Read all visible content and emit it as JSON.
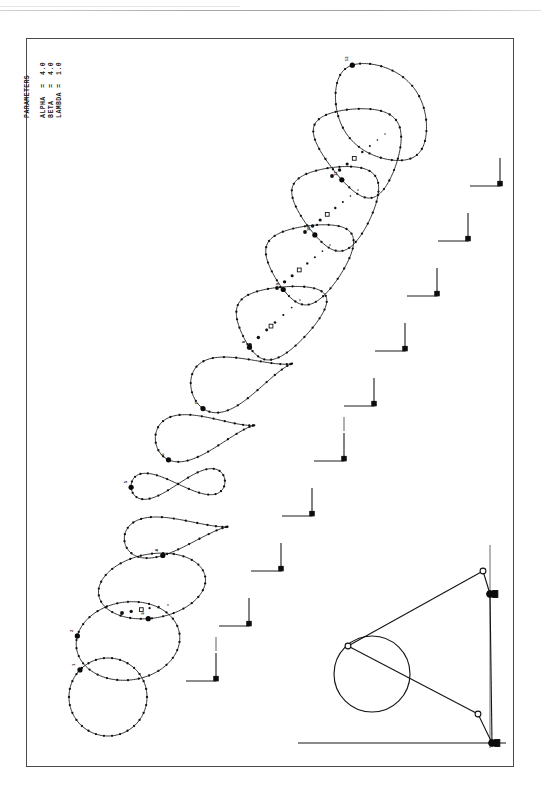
{
  "figure": {
    "background_color": "#ffffff",
    "ink_color": "#101010",
    "frame": {
      "x": 26,
      "y": 38,
      "width": 486,
      "height": 727,
      "border_color": "#4a4a4a"
    }
  },
  "parameters": {
    "heading": "PARAMETERS",
    "lines": [
      {
        "name": "ALPHA",
        "operator": "=",
        "value": "4.0"
      },
      {
        "name": "BETA",
        "operator": "=",
        "value": "4.0"
      },
      {
        "name": "LAMBDA",
        "operator": "=",
        "value": "1.0"
      }
    ],
    "text_block": "PARAMETERS\n\nALPHA  =  4.0\nBETA   =  4.0\nLAMBDA =  1.0",
    "orientation": "rotated-90-ccw"
  },
  "chart_data": {
    "type": "line",
    "xlabel": "",
    "ylabel": "",
    "grid": false,
    "legend": "none",
    "series": [
      {
        "name": "curve-1",
        "shape": "circle",
        "label": "1",
        "cx": 108,
        "cy": 697,
        "rx": 39,
        "ry": 39,
        "rot": 0,
        "samples": 30,
        "marker_label_at": 0.62
      },
      {
        "name": "curve-2",
        "shape": "ellipse",
        "label": "2",
        "cx": 128,
        "cy": 641,
        "rx": 52,
        "ry": 39,
        "rot": -8,
        "samples": 30,
        "marker_label_at": 0.55
      },
      {
        "name": "curve-3",
        "shape": "ellipse",
        "label": "3",
        "cx": 152,
        "cy": 586,
        "rx": 54,
        "ry": 32,
        "rot": -10,
        "samples": 30,
        "marker_label_at": 0.28
      },
      {
        "name": "curve-4",
        "shape": "teardrop",
        "label": "4",
        "cx": 176,
        "cy": 534,
        "rx": 52,
        "ry": 20,
        "rot": -8,
        "samples": 28,
        "marker_label_at": 0.3
      },
      {
        "name": "curve-5",
        "shape": "figure-eight",
        "label": "5",
        "cx": 178,
        "cy": 484,
        "rx": 47,
        "ry": 13,
        "rot": -4,
        "samples": 28,
        "marker_label_at": 0.5
      },
      {
        "name": "curve-6",
        "shape": "teardrop",
        "label": "6",
        "cx": 205,
        "cy": 434,
        "rx": 50,
        "ry": 23,
        "rot": -10,
        "samples": 28,
        "marker_label_at": 0.4
      },
      {
        "name": "curve-7",
        "shape": "teardrop",
        "label": "7",
        "cx": 242,
        "cy": 378,
        "rx": 52,
        "ry": 27,
        "rot": -16,
        "samples": 28,
        "marker_label_at": 0.42
      },
      {
        "name": "curve-8",
        "shape": "crescent",
        "label": "8",
        "cx": 272,
        "cy": 322,
        "rx": 46,
        "ry": 34,
        "rot": -26,
        "samples": 28,
        "marker_label_at": 0.45
      },
      {
        "name": "curve-9",
        "shape": "crescent",
        "label": "9",
        "cx": 303,
        "cy": 264,
        "rx": 44,
        "ry": 38,
        "rot": -32,
        "samples": 28,
        "marker_label_at": 0.46
      },
      {
        "name": "curve-10",
        "shape": "crescent",
        "label": "10",
        "cx": 331,
        "cy": 208,
        "rx": 42,
        "ry": 42,
        "rot": -36,
        "samples": 28,
        "marker_label_at": 0.46
      },
      {
        "name": "curve-11",
        "shape": "crescent",
        "label": "11",
        "cx": 355,
        "cy": 152,
        "rx": 40,
        "ry": 47,
        "rot": -38,
        "samples": 28,
        "marker_label_at": 0.46
      },
      {
        "name": "curve-12",
        "shape": "lens",
        "label": "12",
        "cx": 381,
        "cy": 112,
        "rx": 37,
        "ry": 56,
        "rot": -40,
        "samples": 28,
        "marker_label_at": 0.46
      }
    ],
    "dotted_trails": [
      {
        "name": "trail-a",
        "from": [
          250,
          345
        ],
        "to": [
          300,
          300
        ],
        "dots": 7
      },
      {
        "name": "trail-b",
        "from": [
          277,
          288
        ],
        "to": [
          330,
          245
        ],
        "dots": 8
      },
      {
        "name": "trail-c",
        "from": [
          305,
          232
        ],
        "to": [
          358,
          190
        ],
        "dots": 8
      },
      {
        "name": "trail-d",
        "from": [
          332,
          176
        ],
        "to": [
          385,
          134
        ],
        "dots": 8
      },
      {
        "name": "trail-e",
        "from": [
          122,
          613
        ],
        "to": [
          168,
          605
        ],
        "dots": 6
      }
    ],
    "axis_markers": {
      "count": 10,
      "description": "Small L-shaped coordinate-axis crosshairs stepping diagonally down-left, one per coupler curve position",
      "positions": [
        [
          500,
          186
        ],
        [
          468,
          241
        ],
        [
          437,
          296
        ],
        [
          405,
          351
        ],
        [
          374,
          406
        ],
        [
          344,
          461
        ],
        [
          312,
          516
        ],
        [
          281,
          571
        ],
        [
          249,
          626
        ],
        [
          216,
          681
        ]
      ]
    }
  },
  "mechanism": {
    "name": "four-bar-linkage",
    "description": "Crank-rocker linkage drawn in the lower right corner with the coupler point circle",
    "circle": {
      "cx": 372,
      "cy": 674,
      "r": 38
    },
    "joints": [
      {
        "name": "coupler-point",
        "x": 348,
        "y": 646,
        "type": "open"
      },
      {
        "name": "upper-crank-pin",
        "x": 483,
        "y": 571,
        "type": "open"
      },
      {
        "name": "upper-ground",
        "x": 490,
        "y": 594,
        "type": "fixed"
      },
      {
        "name": "lower-crank-pin",
        "x": 478,
        "y": 714,
        "type": "open"
      },
      {
        "name": "lower-ground",
        "x": 492,
        "y": 743,
        "type": "fixed"
      }
    ],
    "links": [
      {
        "name": "coupler-upper",
        "from": "coupler-point",
        "to": "upper-crank-pin"
      },
      {
        "name": "crank-upper",
        "from": "upper-crank-pin",
        "to": "upper-ground"
      },
      {
        "name": "coupler-lower",
        "from": "coupler-point",
        "to": "lower-crank-pin"
      },
      {
        "name": "crank-lower",
        "from": "lower-crank-pin",
        "to": "lower-ground"
      },
      {
        "name": "frame-vertical",
        "from": "upper-ground",
        "to": "lower-ground"
      }
    ],
    "ground_line": {
      "x1": 298,
      "y1": 743,
      "x2": 506,
      "y2": 743
    },
    "vertical_guide": {
      "x1": 490,
      "y1": 545,
      "x2": 490,
      "y2": 748
    }
  }
}
